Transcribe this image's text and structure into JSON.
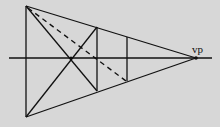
{
  "diagram": {
    "type": "one-point perspective construction",
    "background": "#d7d7d7",
    "line_color": "#111111",
    "labels": {
      "vanishing_point": "vp"
    },
    "points": {
      "top_left": [
        26,
        6
      ],
      "bottom_left": [
        26,
        117
      ],
      "vp": [
        196,
        58
      ],
      "diag_cross": [
        71,
        58
      ],
      "v1_top": [
        97,
        27
      ],
      "v1_bottom": [
        97,
        91
      ],
      "v2_top": [
        127,
        37
      ],
      "v2_bottom": [
        127,
        81
      ]
    },
    "horizon": {
      "x1": 9,
      "x2": 212,
      "y": 58
    }
  }
}
